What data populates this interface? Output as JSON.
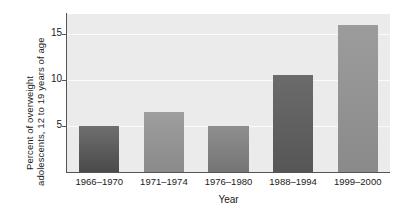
{
  "chart_data": {
    "type": "bar",
    "title": "",
    "subtitle": "",
    "xlabel": "Year",
    "ylabel": "Percent of overweight adolescents, 12 to 19 years of age",
    "ylabel_lines": [
      "Percent of overweight",
      "adolescents, 12 to 19 years of age"
    ],
    "categories": [
      "1966–1970",
      "1971–1974",
      "1976–1980",
      "1988–1994",
      "1999–2000"
    ],
    "values": [
      5.0,
      6.5,
      5.0,
      10.6,
      16.0
    ],
    "ylim": [
      0,
      17.2
    ],
    "xlim": [
      0,
      5
    ],
    "yticks": [
      5,
      10,
      15
    ],
    "ytick_labels": [
      "5",
      "10",
      "15"
    ],
    "grid": true,
    "grid_axis": "y",
    "legend": false,
    "legend_position": "none",
    "bar_colors_top": [
      "#6f6f6f",
      "#9e9e9e",
      "#8e8e8e",
      "#6b6b6b",
      "#9c9c9c"
    ],
    "bar_colors_bottom": [
      "#4a4a4a",
      "#8a8a8a",
      "#757575",
      "#565656",
      "#8a8a8a"
    ],
    "plot_background": "#ebebeb",
    "gridline_color": "#fbfbfb",
    "axis_color": "#555555",
    "text_color": "#1a1a1a",
    "figure_background": "#ffffff",
    "bar_width_fraction": 0.62
  }
}
